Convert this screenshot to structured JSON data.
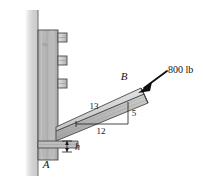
{
  "figure": {
    "type": "statics-free-body-diagram",
    "background_color": "#ffffff"
  },
  "labels": {
    "point_b": "B",
    "point_a": "A",
    "force": "800 lb",
    "hypotenuse": "13",
    "base": "12",
    "rise": "5",
    "height": "h"
  },
  "colors": {
    "wall": "#d8d8d8",
    "post": "#b4b4b4",
    "post_dark": "#9a9a9a",
    "beam": "#b9b9b9",
    "beam_top": "#d0d0d0",
    "beam_edge": "#6e6e6e",
    "bolt": "#c8c8c8",
    "outline": "#3a3a3a",
    "arrow": "#111111",
    "text": "#111111"
  },
  "geometry": {
    "wall_x": 28,
    "post_left": 34,
    "post_right": 58,
    "post_top": 22,
    "post_bottom": 160,
    "beam_start_x": 58,
    "beam_start_y": 128,
    "beam_end_x": 146,
    "beam_end_y": 83,
    "bolt_count": 3,
    "triangle_base": 12,
    "triangle_rise": 5,
    "triangle_hyp": 13
  },
  "icons": {
    "force_arrow": "arrow-down-left-icon",
    "dimension_arrows": "double-headed-arrow-icon"
  }
}
